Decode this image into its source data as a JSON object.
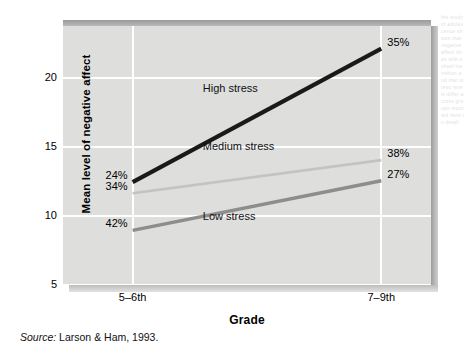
{
  "figure": {
    "source_note_prefix": "Source:",
    "source_note_text": "Larson & Ham, 1993.",
    "page_bleed_text": "the study of adolescence shows that negative affect rises with school transition and that stress levels differ across groups reported here in detail"
  },
  "chart_data": {
    "type": "line",
    "title": "",
    "xlabel": "Grade",
    "ylabel": "Mean level of negative affect",
    "categories": [
      "5–6th",
      "7–9th"
    ],
    "x": [
      0,
      1
    ],
    "xtick_labels": [
      "5–6th",
      "7–9th"
    ],
    "ytick_labels": [
      "5",
      "10",
      "15",
      "20"
    ],
    "yticks": [
      5,
      10,
      15,
      20
    ],
    "ylim": [
      5,
      23.8
    ],
    "xlim": [
      -0.28,
      1.2
    ],
    "grid": "white horizontal at y ticks, vertical at x categories",
    "legend": "inline series labels inside plot",
    "plot_background": "#dededd",
    "series": [
      {
        "name": "High stress",
        "label": "High stress",
        "color": "#1a1a1a",
        "width": 4.2,
        "values": [
          12.9,
          22.6
        ],
        "start_pct": "24%",
        "end_pct": "35%",
        "label_x_pct": 38,
        "label_y": 19.2
      },
      {
        "name": "Medium stress",
        "label": "Medium stress",
        "color": "#c3c3c3",
        "width": 2.6,
        "values": [
          12.1,
          14.5
        ],
        "start_pct": "34%",
        "end_pct": "38%",
        "label_x_pct": 38,
        "label_y": 15.0
      },
      {
        "name": "Low stress",
        "label": "Low stress",
        "color": "#8d8d8d",
        "width": 3.4,
        "values": [
          9.4,
          13.0
        ],
        "start_pct": "42%",
        "end_pct": "27%",
        "label_x_pct": 38,
        "label_y": 9.9
      }
    ]
  }
}
